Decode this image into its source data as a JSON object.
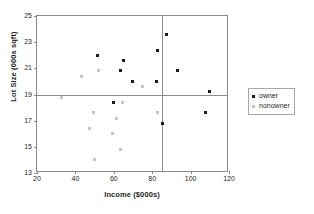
{
  "chart_data": {
    "type": "scatter",
    "title": "",
    "xlabel": "Income ($000s)",
    "ylabel": "Lot Size (000s sqft)",
    "xlim": [
      20,
      120
    ],
    "ylim": [
      13,
      25
    ],
    "xticks": [
      20,
      40,
      60,
      80,
      100,
      120
    ],
    "yticks": [
      13,
      15,
      17,
      19,
      21,
      23,
      25
    ],
    "grid": false,
    "legend_position": "right",
    "reference_lines": [
      {
        "orientation": "horizontal",
        "value": 19
      },
      {
        "orientation": "vertical",
        "value": 85
      }
    ],
    "series": [
      {
        "name": "owner",
        "color": "#1a1a1a",
        "points": [
          {
            "x": 51.5,
            "y": 22.0
          },
          {
            "x": 65.0,
            "y": 21.6
          },
          {
            "x": 63.5,
            "y": 20.8
          },
          {
            "x": 69.5,
            "y": 20.0
          },
          {
            "x": 82.0,
            "y": 20.0
          },
          {
            "x": 82.5,
            "y": 22.4
          },
          {
            "x": 87.5,
            "y": 23.6
          },
          {
            "x": 93.0,
            "y": 20.8
          },
          {
            "x": 110.0,
            "y": 19.2
          },
          {
            "x": 60.0,
            "y": 18.4
          },
          {
            "x": 85.5,
            "y": 16.8
          },
          {
            "x": 108.0,
            "y": 17.6
          }
        ]
      },
      {
        "name": "nonowner",
        "color": "#c4c4c4",
        "points": [
          {
            "x": 43.0,
            "y": 20.4
          },
          {
            "x": 52.0,
            "y": 20.8
          },
          {
            "x": 75.0,
            "y": 19.6
          },
          {
            "x": 33.0,
            "y": 18.8
          },
          {
            "x": 64.5,
            "y": 18.4
          },
          {
            "x": 83.0,
            "y": 17.6
          },
          {
            "x": 49.5,
            "y": 17.6
          },
          {
            "x": 61.5,
            "y": 17.2
          },
          {
            "x": 47.5,
            "y": 16.4
          },
          {
            "x": 59.5,
            "y": 16.0
          },
          {
            "x": 63.5,
            "y": 14.8
          },
          {
            "x": 50.0,
            "y": 14.0
          }
        ]
      }
    ]
  },
  "legend": {
    "entries": [
      {
        "label": "owner"
      },
      {
        "label": "nonowner"
      }
    ]
  }
}
